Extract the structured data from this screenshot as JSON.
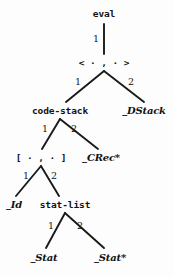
{
  "diagram": {
    "kind": "syntax-tree",
    "canvas": {
      "width": 174,
      "height": 277
    },
    "colors": {
      "background": "#fdfdfd",
      "ink": "#121212",
      "edge": "#1a1a1a"
    },
    "nodes": [
      {
        "id": "eval",
        "label": "eval",
        "style": "mono",
        "x": 104,
        "y": 14
      },
      {
        "id": "pair",
        "label": "< · , · >",
        "style": "mono",
        "x": 104,
        "y": 63
      },
      {
        "id": "codestack",
        "label": "code-stack",
        "style": "mono",
        "x": 60,
        "y": 111
      },
      {
        "id": "dstack",
        "label": "_DStack",
        "style": "ital",
        "x": 144,
        "y": 111
      },
      {
        "id": "brackets",
        "label": "[ · , · ]",
        "style": "mono",
        "x": 41,
        "y": 158
      },
      {
        "id": "crec",
        "label": "_CRec*",
        "style": "ital",
        "x": 101,
        "y": 158
      },
      {
        "id": "id",
        "label": "_Id",
        "style": "ital",
        "x": 14,
        "y": 205
      },
      {
        "id": "statlist",
        "label": "stat-list",
        "style": "mono",
        "x": 65,
        "y": 205
      },
      {
        "id": "stat",
        "label": "_Stat",
        "style": "ital",
        "x": 44,
        "y": 258
      },
      {
        "id": "statstar",
        "label": "_Stat*",
        "style": "ital",
        "x": 110,
        "y": 258
      }
    ],
    "edges": [
      {
        "from": "eval",
        "to": "pair",
        "label": "1",
        "x1": 104,
        "y1": 24,
        "x2": 104,
        "y2": 54,
        "lx": 96,
        "ly": 39
      },
      {
        "from": "pair",
        "to": "codestack",
        "label": "1",
        "x1": 104,
        "y1": 71,
        "x2": 66,
        "y2": 102,
        "lx": 78,
        "ly": 82
      },
      {
        "from": "pair",
        "to": "dstack",
        "label": "2",
        "x1": 104,
        "y1": 71,
        "x2": 144,
        "y2": 102,
        "lx": 131,
        "ly": 82
      },
      {
        "from": "codestack",
        "to": "brackets",
        "label": "1",
        "x1": 60,
        "y1": 119,
        "x2": 42,
        "y2": 149,
        "lx": 45,
        "ly": 129
      },
      {
        "from": "codestack",
        "to": "crec",
        "label": "2",
        "x1": 60,
        "y1": 119,
        "x2": 98,
        "y2": 149,
        "lx": 74,
        "ly": 129
      },
      {
        "from": "brackets",
        "to": "id",
        "label": "1",
        "x1": 41,
        "y1": 166,
        "x2": 16,
        "y2": 196,
        "lx": 26,
        "ly": 176
      },
      {
        "from": "brackets",
        "to": "statlist",
        "label": "2",
        "x1": 41,
        "y1": 166,
        "x2": 59,
        "y2": 196,
        "lx": 54,
        "ly": 176
      },
      {
        "from": "statlist",
        "to": "stat",
        "label": "1",
        "x1": 65,
        "y1": 213,
        "x2": 46,
        "y2": 248,
        "lx": 51,
        "ly": 226
      },
      {
        "from": "statlist",
        "to": "statstar",
        "label": "2",
        "x1": 65,
        "y1": 213,
        "x2": 104,
        "y2": 248,
        "lx": 80,
        "ly": 226
      }
    ]
  }
}
